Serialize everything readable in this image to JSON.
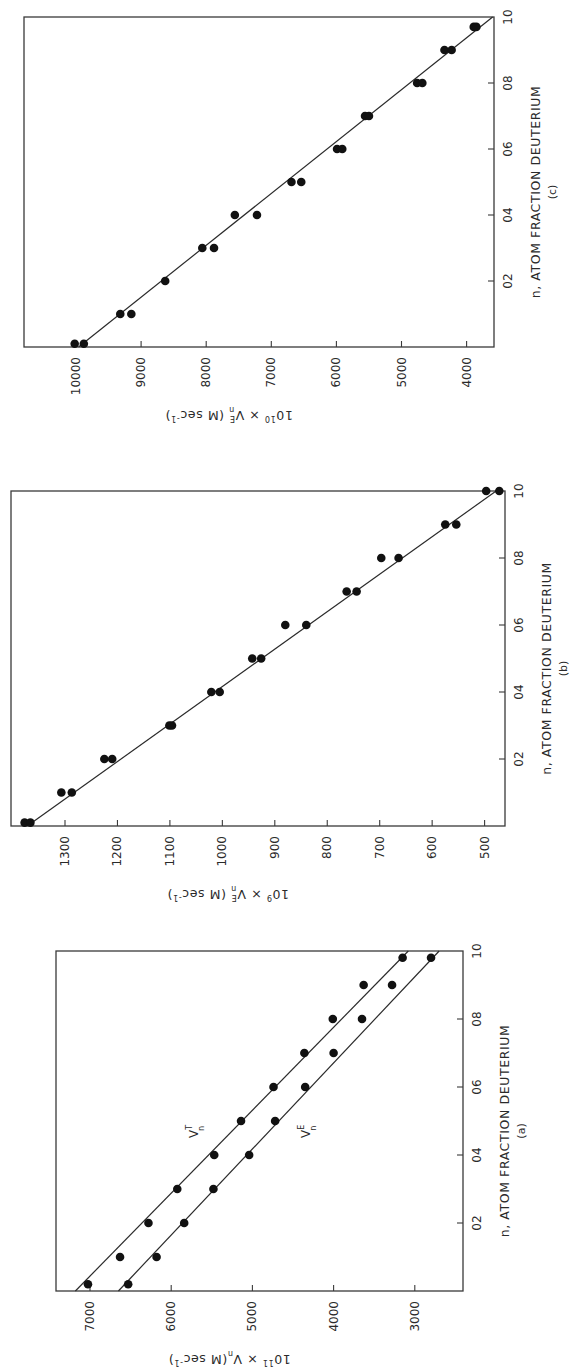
{
  "figure": {
    "orientation": "rotated 90 degrees counterclockwise",
    "panels_order_top_to_bottom": [
      "c",
      "b",
      "a"
    ]
  },
  "chart_data": [
    {
      "panel": "(a)",
      "type": "scatter",
      "title": "",
      "xlabel": "n, ATOM FRACTION DEUTERIUM",
      "ylabel": "10^11 × V_n (M sec^-1)",
      "ylabel_parts": {
        "prefix": "10",
        "exp": "11",
        "mid": " × V",
        "sub": "n",
        "unit": "(M sec",
        "unit_exp": "-1",
        "close": ")"
      },
      "caption": "(a)",
      "x_ticks": [
        "02",
        "04",
        "06",
        "08",
        "10"
      ],
      "x_tick_values": [
        0.2,
        0.4,
        0.6,
        0.8,
        1.0
      ],
      "y_ticks": [
        "7000",
        "6000",
        "5000",
        "4000",
        "3000"
      ],
      "y_tick_values": [
        7000,
        6000,
        5000,
        4000,
        3000
      ],
      "xlim": [
        0,
        1.0
      ],
      "ylim": [
        2450,
        7400
      ],
      "grid": false,
      "legend": "inline labels",
      "series": [
        {
          "name": "V_n^T",
          "label_main": "V",
          "label_sup": "T",
          "label_sub": "n",
          "x": [
            0.02,
            0.1,
            0.2,
            0.3,
            0.4,
            0.5,
            0.6,
            0.7,
            0.8,
            0.9,
            0.98
          ],
          "values": [
            7025,
            6630,
            6280,
            5925,
            5470,
            5140,
            4740,
            4360,
            4010,
            3630,
            3150
          ],
          "fit_line": {
            "x": [
              0,
              1.0
            ],
            "y": [
              7180,
              3080
            ]
          }
        },
        {
          "name": "V_n^E",
          "label_main": "V",
          "label_sup": "E",
          "label_sub": "n",
          "x": [
            0.02,
            0.1,
            0.2,
            0.3,
            0.4,
            0.5,
            0.6,
            0.7,
            0.8,
            0.9,
            0.98
          ],
          "values": [
            6530,
            6180,
            5840,
            5480,
            5040,
            4720,
            4350,
            4000,
            3650,
            3280,
            2800
          ],
          "fit_line": {
            "x": [
              0,
              1.0
            ],
            "y": [
              6650,
              2700
            ]
          }
        }
      ]
    },
    {
      "panel": "(b)",
      "type": "scatter",
      "title": "",
      "xlabel": "n, ATOM FRACTION DEUTERIUM",
      "ylabel": "10^9 × V_n^E (M sec^-1)",
      "ylabel_parts": {
        "prefix": "10",
        "exp": "9",
        "mid": " × V",
        "sup": "E",
        "sub": "n",
        "unit": "(M sec",
        "unit_exp": "-1",
        "close": ")"
      },
      "caption": "(b)",
      "x_ticks": [
        "02",
        "04",
        "06",
        "08",
        "10"
      ],
      "x_tick_values": [
        0.2,
        0.4,
        0.6,
        0.8,
        1.0
      ],
      "y_ticks": [
        "1300",
        "1200",
        "1100",
        "1000",
        "900",
        "800",
        "700",
        "600",
        "500"
      ],
      "y_tick_values": [
        1300,
        1200,
        1100,
        1000,
        900,
        800,
        700,
        600,
        500
      ],
      "xlim": [
        0,
        1.0
      ],
      "ylim": [
        460,
        1385
      ],
      "grid": false,
      "series": [
        {
          "name": "V_n^E",
          "x": [
            0.01,
            0.01,
            0.1,
            0.1,
            0.2,
            0.2,
            0.3,
            0.3,
            0.4,
            0.4,
            0.5,
            0.5,
            0.6,
            0.6,
            0.7,
            0.7,
            0.8,
            0.8,
            0.9,
            0.9,
            1.0,
            1.0
          ],
          "values": [
            1377,
            1366,
            1307,
            1287,
            1225,
            1210,
            1101,
            1096,
            1021,
            1005,
            943,
            926,
            880,
            840,
            763,
            744,
            697,
            664,
            575,
            554,
            497,
            472
          ],
          "fit_line": {
            "x": [
              0,
              1.0
            ],
            "y": [
              1372,
              478
            ]
          }
        }
      ]
    },
    {
      "panel": "(c)",
      "type": "scatter",
      "title": "",
      "xlabel": "n, ATOM FRACTION DEUTERIUM",
      "ylabel": "10^10 × V_n^E (M sec^-1)",
      "ylabel_parts": {
        "prefix": "10",
        "exp": "10",
        "mid": " × V",
        "sup": "E",
        "sub": "n",
        "unit": "(M sec",
        "unit_exp": "-1",
        "close": ")"
      },
      "caption": "(c)",
      "x_ticks": [
        "02",
        "04",
        "06",
        "08",
        "10"
      ],
      "x_tick_values": [
        0.2,
        0.4,
        0.6,
        0.8,
        1.0
      ],
      "y_ticks": [
        "10000",
        "9000",
        "8000",
        "7000",
        "6000",
        "5000",
        "4000"
      ],
      "y_tick_values": [
        10000,
        9000,
        8000,
        7000,
        6000,
        5000,
        4000
      ],
      "xlim": [
        0,
        1.0
      ],
      "ylim": [
        3560,
        10800
      ],
      "grid": false,
      "series": [
        {
          "name": "V_n^E",
          "x": [
            0.01,
            0.01,
            0.1,
            0.1,
            0.2,
            0.3,
            0.3,
            0.4,
            0.4,
            0.5,
            0.5,
            0.6,
            0.6,
            0.7,
            0.7,
            0.8,
            0.8,
            0.9,
            0.9,
            0.97,
            0.97
          ],
          "values": [
            10020,
            9880,
            9320,
            9150,
            8630,
            8060,
            7880,
            7560,
            7220,
            6690,
            6540,
            5990,
            5910,
            5560,
            5500,
            4760,
            4680,
            4340,
            4230,
            3890,
            3850
          ],
          "fit_line": {
            "x": [
              0,
              1.0
            ],
            "y": [
              9960,
              3600
            ]
          }
        }
      ]
    }
  ],
  "layout": {
    "panels": {
      "(c)": {
        "left": 24,
        "right": 494,
        "top": 17,
        "bottom": 347,
        "val_ref": [
          10000,
          76
        ],
        "val_px_per_unit": 0.0651
      },
      "(b)": {
        "left": 11,
        "right": 505,
        "top": 491,
        "bottom": 826,
        "val_ref": [
          1300,
          65
        ],
        "val_px_per_unit": 0.5245
      },
      "(a)": {
        "left": 56,
        "right": 463,
        "top": 951,
        "bottom": 1291,
        "val_ref": [
          7000,
          90
        ],
        "val_px_per_unit": 0.0812
      }
    }
  }
}
